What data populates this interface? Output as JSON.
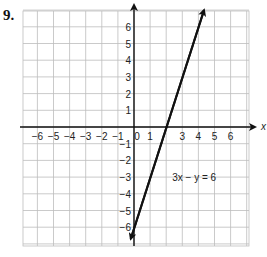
{
  "problem": {
    "number": "9."
  },
  "chart_data": {
    "type": "line",
    "title": "",
    "xlabel": "x",
    "ylabel": "",
    "xlim": [
      -7,
      7
    ],
    "ylim": [
      -7,
      7
    ],
    "grid": true,
    "x_ticks": [
      "-6",
      "-5",
      "-4",
      "-3",
      "-2",
      "-1",
      "0",
      "1",
      "3",
      "4",
      "5",
      "6"
    ],
    "y_ticks": [
      "6",
      "5",
      "4",
      "3",
      "2",
      "1",
      "-1",
      "-2",
      "-3",
      "-4",
      "-5",
      "-6"
    ],
    "series": [
      {
        "name": "3x − y = 6",
        "equation": "y = 3x - 6",
        "x": [
          -0.2,
          0,
          2,
          4.35
        ],
        "y": [
          -6.7,
          -6,
          0,
          7
        ],
        "arrows": "both"
      }
    ],
    "annotations": [
      {
        "text": "3x − y = 6",
        "x": 2.5,
        "y": -3
      }
    ]
  },
  "labels": {
    "x_axis": "x",
    "equation": "3x − y = 6"
  }
}
